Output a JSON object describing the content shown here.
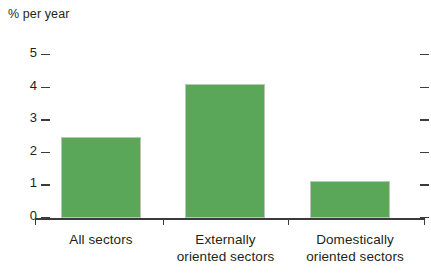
{
  "chart_data": {
    "type": "bar",
    "title": "",
    "subtitle": "",
    "xlabel": "",
    "ylabel": "% per year",
    "categories": [
      "All sectors",
      "Externally\noriented sectors",
      "Domestically\noriented sectors"
    ],
    "values": [
      2.5,
      4.1,
      1.15
    ],
    "ylim": [
      0,
      5
    ],
    "yticks": [
      0,
      1,
      2,
      3,
      4,
      5
    ],
    "ytick_labels": [
      "0",
      "1",
      "2",
      "3",
      "4",
      "5"
    ],
    "grid": false,
    "legend": null,
    "series": [
      {
        "name": "Average annual growth",
        "values": [
          2.5,
          4.1,
          1.15
        ]
      }
    ],
    "colors": {
      "bar_fill": "#5aa75a",
      "bar_border": "#b9c7b4",
      "axis": "#3b3b3b",
      "text": "#231f20",
      "background": "#ffffff"
    },
    "axis_title": "% per year",
    "right_axis_ticks_visible": true
  }
}
